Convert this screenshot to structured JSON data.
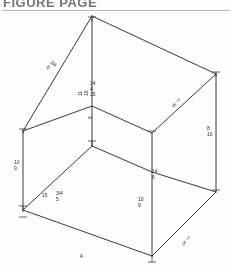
{
  "header": {
    "title": "FIGURE PAGE",
    "rule_color": "#b9b9b9"
  },
  "drawing": {
    "name": "isometric-rectangular-box",
    "description": "Wireframe isometric drawing of a rectangular box with dimension annotations",
    "line_color": "#3a3a3a",
    "background": "#fdfdfd"
  },
  "dimensions": {
    "top_left_edge": "3/4",
    "top_left_edge_sub": "9",
    "vertical_upper_left": "11",
    "vertical_upper_left_sub": "16",
    "center_stack_1": "14",
    "center_stack_2": "4",
    "center_stack_3": "15",
    "center_vertical_mid": "6",
    "top_right_edge": "7",
    "top_right_edge_sub": "8",
    "right_vertical": "8",
    "right_vertical_sub": "10",
    "left_vertical": "10",
    "left_vertical_sub": "9",
    "mid_right_horizontal": "14",
    "mid_right_horizontal_sub": "6",
    "lower_right_vertical": "10",
    "lower_right_vertical_sub": "9",
    "lower_left_a": "15",
    "lower_left_b": "3/4",
    "lower_left_sub": "5",
    "bottom_edge": "4",
    "bottom_right_edge": "7",
    "bottom_right_edge_sub": "5"
  },
  "labels": [
    {
      "id": "d-top-left",
      "text": "3/4",
      "sub": "9"
    },
    {
      "id": "d-vert-upper-left",
      "text": "11",
      "sub": "16"
    },
    {
      "id": "d-center-1",
      "text": "14",
      "sub": ""
    },
    {
      "id": "d-center-2",
      "text": "4",
      "sub": ""
    },
    {
      "id": "d-center-3",
      "text": "15",
      "sub": ""
    },
    {
      "id": "d-center-vert",
      "text": "6",
      "sub": ""
    },
    {
      "id": "d-top-right",
      "text": "7",
      "sub": "8"
    },
    {
      "id": "d-right-vert",
      "text": "8",
      "sub": "10"
    },
    {
      "id": "d-left-vert",
      "text": "10",
      "sub": "9"
    },
    {
      "id": "d-mid-right",
      "text": "14",
      "sub": "6"
    },
    {
      "id": "d-lower-right-v",
      "text": "10",
      "sub": "9"
    },
    {
      "id": "d-lower-left-a",
      "text": "15",
      "sub": ""
    },
    {
      "id": "d-lower-left-b",
      "text": "3/4",
      "sub": "5"
    },
    {
      "id": "d-bottom",
      "text": "4",
      "sub": ""
    },
    {
      "id": "d-bottom-right",
      "text": "7",
      "sub": "5"
    }
  ]
}
